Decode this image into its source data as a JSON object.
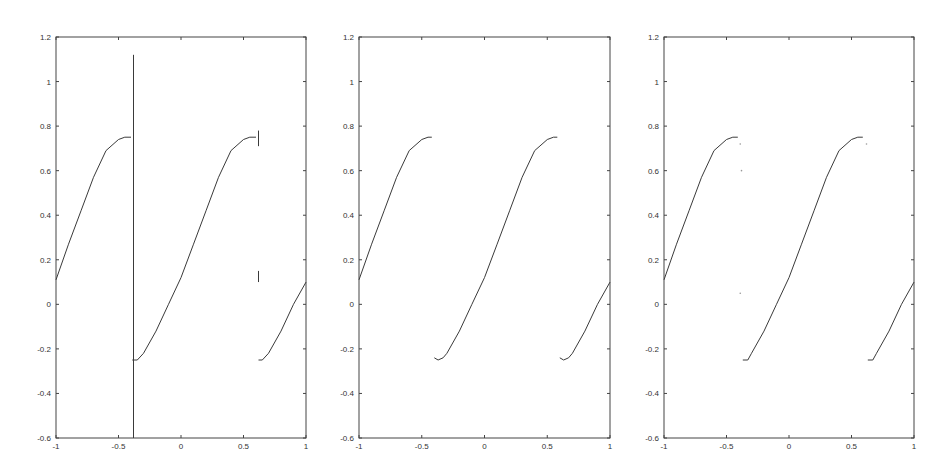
{
  "figure": {
    "panels": [
      {
        "id": "left",
        "box": {
          "left": 56,
          "top": 37,
          "right": 306,
          "bottom": 438
        }
      },
      {
        "id": "middle",
        "box": {
          "left": 359,
          "top": 37,
          "right": 610,
          "bottom": 438
        }
      },
      {
        "id": "right",
        "box": {
          "left": 664,
          "top": 37,
          "right": 914,
          "bottom": 438
        }
      }
    ],
    "line_color": "#3a3a3a",
    "axis_color": "#444444"
  },
  "chart_data": [
    {
      "type": "line",
      "title": "",
      "xlabel": "",
      "ylabel": "",
      "xlim": [
        -1,
        1
      ],
      "ylim": [
        -0.6,
        1.2
      ],
      "xticks": [
        "-1",
        "-0.5",
        "0",
        "0.5",
        "1"
      ],
      "yticks": [
        "-0.6",
        "-0.4",
        "-0.2",
        "0",
        "0.2",
        "0.4",
        "0.6",
        "0.8",
        "1",
        "1.2"
      ],
      "grid": false,
      "series": [
        {
          "name": "segment-1",
          "x": [
            -1,
            -0.9,
            -0.8,
            -0.7,
            -0.6,
            -0.5,
            -0.45,
            -0.4
          ],
          "y": [
            0.11,
            0.27,
            0.42,
            0.57,
            0.69,
            0.74,
            0.75,
            0.75
          ]
        },
        {
          "name": "segment-2",
          "x": [
            -0.39,
            -0.35,
            -0.3,
            -0.2,
            -0.1,
            0,
            0.1,
            0.2,
            0.3,
            0.4,
            0.5,
            0.55,
            0.6
          ],
          "y": [
            -0.25,
            -0.25,
            -0.22,
            -0.12,
            0.0,
            0.12,
            0.27,
            0.42,
            0.57,
            0.69,
            0.74,
            0.75,
            0.75
          ]
        },
        {
          "name": "segment-3",
          "x": [
            0.62,
            0.65,
            0.7,
            0.8,
            0.9,
            1.0
          ],
          "y": [
            -0.25,
            -0.25,
            -0.22,
            -0.12,
            0.0,
            0.1
          ]
        }
      ],
      "annotations": [
        {
          "type": "vertical-spike",
          "x": -0.38,
          "y_from": -0.6,
          "y_to": 1.12
        },
        {
          "type": "spike",
          "x": 0.62,
          "y_from": 0.71,
          "y_to": 0.78
        },
        {
          "type": "spike",
          "x": 0.62,
          "y_from": 0.1,
          "y_to": 0.15
        }
      ]
    },
    {
      "type": "line",
      "title": "",
      "xlabel": "",
      "ylabel": "",
      "xlim": [
        -1,
        1
      ],
      "ylim": [
        -0.6,
        1.2
      ],
      "xticks": [
        "-1",
        "-0.5",
        "0",
        "0.5",
        "1"
      ],
      "yticks": [
        "-0.6",
        "-0.4",
        "-0.2",
        "0",
        "0.2",
        "0.4",
        "0.6",
        "0.8",
        "1",
        "1.2"
      ],
      "grid": false,
      "series": [
        {
          "name": "segment-1",
          "x": [
            -1,
            -0.9,
            -0.8,
            -0.7,
            -0.6,
            -0.5,
            -0.45,
            -0.42
          ],
          "y": [
            0.11,
            0.27,
            0.42,
            0.57,
            0.69,
            0.74,
            0.75,
            0.75
          ]
        },
        {
          "name": "segment-2",
          "x": [
            -0.4,
            -0.37,
            -0.33,
            -0.3,
            -0.2,
            -0.1,
            0,
            0.1,
            0.2,
            0.3,
            0.4,
            0.5,
            0.55,
            0.58
          ],
          "y": [
            -0.24,
            -0.25,
            -0.24,
            -0.22,
            -0.12,
            0.0,
            0.12,
            0.27,
            0.42,
            0.57,
            0.69,
            0.74,
            0.75,
            0.75
          ]
        },
        {
          "name": "segment-3",
          "x": [
            0.6,
            0.63,
            0.67,
            0.7,
            0.8,
            0.9,
            1.0
          ],
          "y": [
            -0.24,
            -0.25,
            -0.24,
            -0.22,
            -0.12,
            0.0,
            0.1
          ]
        }
      ]
    },
    {
      "type": "line",
      "title": "",
      "xlabel": "",
      "ylabel": "",
      "xlim": [
        -1,
        1
      ],
      "ylim": [
        -0.6,
        1.2
      ],
      "xticks": [
        "-1",
        "-0.5",
        "0",
        "0.5",
        "1"
      ],
      "yticks": [
        "-0.6",
        "-0.4",
        "-0.2",
        "0",
        "0.2",
        "0.4",
        "0.6",
        "0.8",
        "1",
        "1.2"
      ],
      "grid": false,
      "series": [
        {
          "name": "segment-1",
          "x": [
            -1,
            -0.9,
            -0.8,
            -0.7,
            -0.6,
            -0.5,
            -0.45,
            -0.41
          ],
          "y": [
            0.11,
            0.27,
            0.42,
            0.57,
            0.69,
            0.74,
            0.75,
            0.75
          ]
        },
        {
          "name": "segment-2",
          "x": [
            -0.37,
            -0.33,
            -0.3,
            -0.2,
            -0.1,
            0,
            0.1,
            0.2,
            0.3,
            0.4,
            0.5,
            0.55,
            0.59
          ],
          "y": [
            -0.25,
            -0.25,
            -0.22,
            -0.12,
            0.0,
            0.12,
            0.27,
            0.42,
            0.57,
            0.69,
            0.74,
            0.75,
            0.75
          ]
        },
        {
          "name": "segment-3",
          "x": [
            0.63,
            0.67,
            0.7,
            0.8,
            0.9,
            1.0
          ],
          "y": [
            -0.25,
            -0.25,
            -0.22,
            -0.12,
            0.0,
            0.1
          ]
        }
      ],
      "annotations": [
        {
          "type": "dot",
          "x": -0.39,
          "y": 0.72
        },
        {
          "type": "dot",
          "x": -0.38,
          "y": 0.6
        },
        {
          "type": "dot",
          "x": 0.62,
          "y": 0.72
        },
        {
          "type": "dot",
          "x": -0.39,
          "y": 0.05
        }
      ]
    }
  ]
}
